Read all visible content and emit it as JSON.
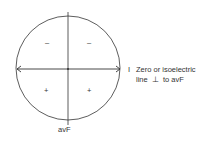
{
  "diagram": {
    "axis_label_right": "I",
    "axis_label_bottom": "avF",
    "annotation_line1": "Zero or isoelectric",
    "annotation_line2_pre": "line",
    "annotation_symbol": "⊥",
    "annotation_line2_post": "to avF",
    "quadrant_signs": {
      "top_left": "–",
      "top_right": "–",
      "bottom_left": "+",
      "bottom_right": "+"
    },
    "colors": {
      "stroke": "#333333",
      "background": "#ffffff"
    }
  }
}
